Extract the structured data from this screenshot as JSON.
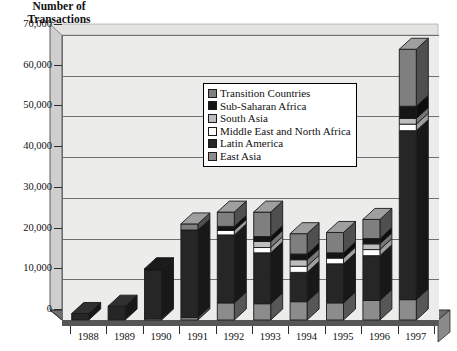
{
  "chart_data": {
    "type": "bar",
    "subtype": "stacked-bar-3d",
    "title": "Number of Transactions",
    "ylabel": "Number of Transactions",
    "xlabel": "",
    "grid": true,
    "legend_position": "inside-top-center",
    "ylim": [
      0,
      70000
    ],
    "ytick_labels": [
      "0",
      "10,000",
      "20,000",
      "30,000",
      "40,000",
      "50,000",
      "60,000",
      "70,000"
    ],
    "ytick_values": [
      0,
      10000,
      20000,
      30000,
      40000,
      50000,
      60000,
      70000
    ],
    "categories": [
      "1988",
      "1989",
      "1990",
      "1991",
      "1992",
      "1993",
      "1994",
      "1995",
      "1996",
      "1997"
    ],
    "series": [
      {
        "name": "East Asia",
        "color": "#8c8c8c",
        "values": [
          0,
          0,
          300,
          600,
          4200,
          4000,
          4500,
          4200,
          4800,
          5000
        ]
      },
      {
        "name": "Latin America",
        "color": "#262626",
        "values": [
          1600,
          3400,
          11900,
          21500,
          16700,
          12500,
          7200,
          9600,
          11000,
          41500
        ]
      },
      {
        "name": "Middle East and North Africa",
        "color": "#ffffff",
        "values": [
          0,
          0,
          0,
          0,
          1100,
          1300,
          1500,
          1400,
          1500,
          1600
        ]
      },
      {
        "name": "South Asia",
        "color": "#bdbdbd",
        "values": [
          0,
          0,
          0,
          0,
          0,
          1500,
          1600,
          0,
          1400,
          1400
        ]
      },
      {
        "name": "Sub-Saharan Africa",
        "color": "#151515",
        "values": [
          0,
          0,
          400,
          0,
          1000,
          1200,
          1400,
          1300,
          1300,
          3000
        ]
      },
      {
        "name": "Transition Countries",
        "color": "#7f7f7f",
        "values": [
          0,
          0,
          0,
          1500,
          3500,
          6000,
          5000,
          5000,
          4700,
          14000
        ]
      }
    ],
    "totals": [
      1600,
      3400,
      12600,
      23600,
      26500,
      26500,
      21200,
      21500,
      24700,
      66500
    ]
  },
  "legend": {
    "items": [
      {
        "label": "Transition Countries",
        "color": "#7f7f7f"
      },
      {
        "label": "Sub-Saharan Africa",
        "color": "#151515"
      },
      {
        "label": "South Asia",
        "color": "#bdbdbd"
      },
      {
        "label": "Middle East and North Africa",
        "color": "#ffffff"
      },
      {
        "label": "Latin America",
        "color": "#262626"
      },
      {
        "label": "East Asia",
        "color": "#8c8c8c"
      }
    ]
  },
  "axis": {
    "title_line1": "Number of",
    "title_line2": "Transactions"
  },
  "colors": {
    "plot_background": "#ececeb",
    "gridline": "#6f6f6f",
    "floor": "#6e6e6e",
    "wall": "#cfcfcf",
    "outline": "#1a1a1a"
  }
}
